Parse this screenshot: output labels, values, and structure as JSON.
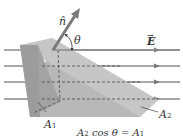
{
  "diagram": {
    "labels": {
      "normal": "n̂",
      "angle": "θ",
      "field": "E",
      "area1": "A",
      "area1_sub": "1",
      "area2": "A",
      "area2_sub": "2",
      "equation_a": "A",
      "equation_a_sub": "2",
      "equation_mid": " cos θ = A",
      "equation_b_sub": "1"
    },
    "colors": {
      "field_line": "#8a8a8a",
      "wedge_front": "#a9a9a9",
      "wedge_top": "#c4c4c4",
      "wedge_side": "#b6b6b6",
      "normal_arrow": "#7a7a7a",
      "dashed": "#444444"
    },
    "field_lines_y": [
      50,
      66,
      82,
      99
    ]
  }
}
